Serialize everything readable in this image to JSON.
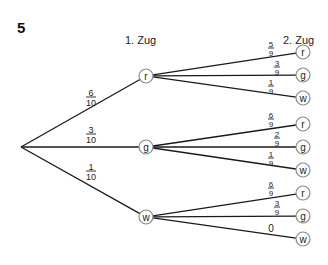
{
  "task_number": "5",
  "headings": {
    "first_draw": "1. Zug",
    "second_draw": "2. Zug"
  },
  "root": {
    "x": 21,
    "y": 147
  },
  "level1": [
    {
      "label": "r",
      "x": 146,
      "y": 76,
      "prob": {
        "num": "6",
        "den": "10"
      },
      "prob_pos": {
        "x": 91,
        "y": 97
      }
    },
    {
      "label": "g",
      "x": 146,
      "y": 147,
      "prob": {
        "num": "3",
        "den": "10"
      },
      "prob_pos": {
        "x": 91,
        "y": 134
      }
    },
    {
      "label": "w",
      "x": 146,
      "y": 217,
      "prob": {
        "num": "1",
        "den": "10"
      },
      "prob_pos": {
        "x": 91,
        "y": 171
      }
    }
  ],
  "level2": [
    {
      "parent": 0,
      "label": "r",
      "x": 303,
      "y": 52,
      "prob": {
        "num": "5",
        "den": "9"
      },
      "prob_pos": {
        "x": 271,
        "y": 48
      }
    },
    {
      "parent": 0,
      "label": "g",
      "x": 303,
      "y": 75,
      "prob": {
        "num": "3",
        "den": "9"
      },
      "prob_pos": {
        "x": 277,
        "y": 67
      }
    },
    {
      "parent": 0,
      "label": "w",
      "x": 303,
      "y": 98,
      "prob": {
        "num": "1",
        "den": "9"
      },
      "prob_pos": {
        "x": 271,
        "y": 86
      }
    },
    {
      "parent": 1,
      "label": "r",
      "x": 303,
      "y": 124,
      "prob": {
        "num": "6",
        "den": "9"
      },
      "prob_pos": {
        "x": 271,
        "y": 119
      }
    },
    {
      "parent": 1,
      "label": "g",
      "x": 303,
      "y": 147,
      "prob": {
        "num": "2",
        "den": "9"
      },
      "prob_pos": {
        "x": 277,
        "y": 138
      }
    },
    {
      "parent": 1,
      "label": "w",
      "x": 303,
      "y": 170,
      "prob": {
        "num": "1",
        "den": "9"
      },
      "prob_pos": {
        "x": 271,
        "y": 158
      }
    },
    {
      "parent": 2,
      "label": "r",
      "x": 303,
      "y": 193,
      "prob": {
        "num": "6",
        "den": "9"
      },
      "prob_pos": {
        "x": 271,
        "y": 188
      }
    },
    {
      "parent": 2,
      "label": "g",
      "x": 303,
      "y": 216,
      "prob": {
        "num": "3",
        "den": "9"
      },
      "prob_pos": {
        "x": 277,
        "y": 207
      }
    },
    {
      "parent": 2,
      "label": "w",
      "x": 303,
      "y": 239,
      "prob": {
        "plain": "0"
      },
      "prob_pos": {
        "x": 271,
        "y": 228
      }
    }
  ],
  "style": {
    "edge_color": "#1a1a1a",
    "circle_stroke": "#8a8a8a",
    "node_radius": 7
  }
}
